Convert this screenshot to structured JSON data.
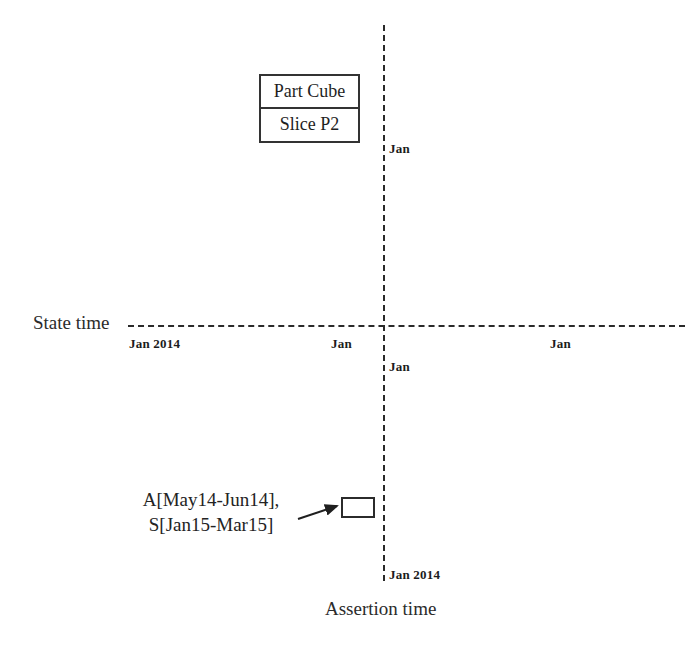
{
  "diagram": {
    "axes": {
      "state_time_label": "State time",
      "assertion_time_label": "Assertion time"
    },
    "ticks": {
      "state_left": "Jan 2014",
      "state_mid": "Jan",
      "state_right": "Jan",
      "assertion_top": "Jan",
      "assertion_mid": "Jan",
      "assertion_bottom": "Jan 2014"
    },
    "cube_box": {
      "title": "Part Cube",
      "subtitle": "Slice P2"
    },
    "annotation": {
      "line1": "A[May14-Jun14],",
      "line2": "S[Jan15-Mar15]"
    },
    "colors": {
      "background": "#ffffff",
      "line": "#2a2a2a",
      "text": "#1f1f1f",
      "box_border": "#333333"
    }
  }
}
